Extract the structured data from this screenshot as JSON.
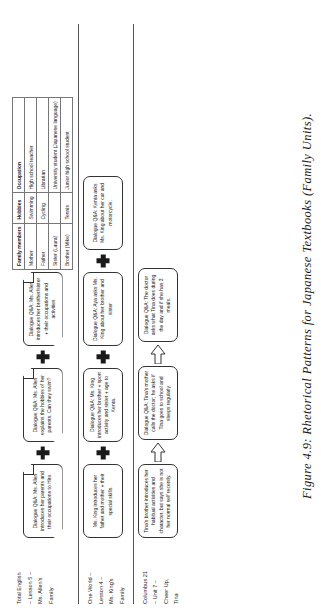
{
  "figure": {
    "caption": "Figure 4.9: Rhetorical Patterns for Japanese Textbooks (Family Units)."
  },
  "rows": [
    {
      "id": "total-english",
      "label_lines": [
        "Total English",
        "– Lesson 5 –",
        "Ms. Allen's",
        "Family"
      ],
      "nodes": [
        {
          "type": "box-fold",
          "text": "Dialogue Q&A: Ms. Allen introduces her parents and their occupations to Hiro."
        },
        {
          "type": "plus"
        },
        {
          "type": "box-fold",
          "text": "Dialogue Q&A: Ms. Allen explains the hobbies of her parents. Can they swim?"
        },
        {
          "type": "plus"
        },
        {
          "type": "box-fold",
          "text": "Dialogue Q&A: Ms. Allen introduces her brother/sister + their occupations and activities"
        }
      ],
      "table": {
        "headers": [
          "Family members",
          "Hobbies",
          "Occupation"
        ],
        "rows": [
          [
            "Mother",
            "Swimming",
            "High school teacher"
          ],
          [
            "Father",
            "Cycling",
            "Librarian"
          ],
          [
            "Sister (Laura)",
            "",
            "University student (Japanese language)"
          ],
          [
            "Brother (Mike)",
            "Tennis",
            "Junior high school student"
          ]
        ]
      }
    },
    {
      "id": "one-world",
      "label_lines": [
        "One World –",
        "Lesson 4 –",
        "Ms. King's",
        "Family"
      ],
      "nodes": [
        {
          "type": "box-round",
          "text": "Ms. King introduces her father and mother + their special skills."
        },
        {
          "type": "plus"
        },
        {
          "type": "box-round",
          "text": "Dialogue Q&A: Ms. King introduces her brother + sport activity and sister + age to Kenta."
        },
        {
          "type": "plus"
        },
        {
          "type": "box-round",
          "text": "Dialogue Q&A: Aya asks Ms. King about her brother and sister"
        },
        {
          "type": "plus"
        },
        {
          "type": "box-round",
          "text": "Dialogue Q&A: Kenta asks Ms. King about her car and motorcycle."
        }
      ]
    },
    {
      "id": "columbus-21",
      "label_lines": [
        "Columbus 21",
        "– Unit 7 –",
        "Cheer Up,",
        "Tina"
      ],
      "nodes": [
        {
          "type": "box-round",
          "text": "Tina's brother introduces her habitual activities and character, but says she is not her normal self recently."
        },
        {
          "type": "arrow"
        },
        {
          "type": "box-round",
          "text": "Dialogue Q&A: Tina's mother calls the doctor; he asks if Tina goes to school and sleeps regularly."
        },
        {
          "type": "arrow"
        },
        {
          "type": "box-round",
          "text": "Dialogue Q&A: The doctor asks what Tina does during the day and if she has 3 meals."
        }
      ]
    }
  ]
}
